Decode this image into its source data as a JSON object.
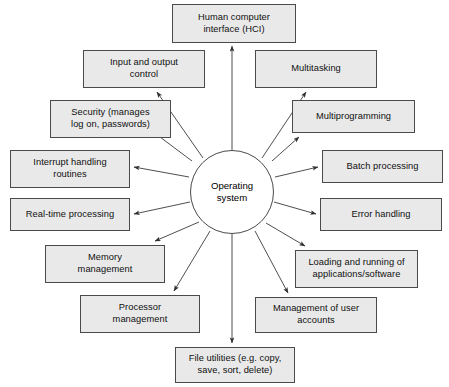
{
  "diagram": {
    "type": "hub-and-spoke",
    "canvas": {
      "width": 449,
      "height": 387,
      "background": "#ffffff"
    },
    "style": {
      "box_fill": "#e9e9e9",
      "box_border": "#4a4a4a",
      "center_fill": "#ffffff",
      "center_border": "#4a4a4a",
      "edge_color": "#3a3a3a",
      "text_color": "#101010"
    },
    "center": {
      "label": "Operating\nsystem",
      "cx": 232,
      "cy": 192,
      "r": 42
    },
    "nodes": [
      {
        "id": "human-computer-interface",
        "label": "Human computer\ninterface (HCI)",
        "x": 172,
        "y": 4,
        "w": 124,
        "h": 39,
        "arrow_from": [
          232,
          150
        ],
        "arrow_to": [
          232,
          46
        ]
      },
      {
        "id": "input-and-output-control",
        "label": "Input and output\ncontrol",
        "x": 83,
        "y": 50,
        "w": 122,
        "h": 38,
        "arrow_from": [
          203,
          158
        ],
        "arrow_to": [
          157,
          92
        ]
      },
      {
        "id": "multitasking",
        "label": "Multitasking",
        "x": 255,
        "y": 50,
        "w": 122,
        "h": 38,
        "arrow_from": [
          262,
          158
        ],
        "arrow_to": [
          306,
          92
        ]
      },
      {
        "id": "security",
        "label": "Security (manages\nlog on, passwords)",
        "x": 50,
        "y": 100,
        "w": 121,
        "h": 38,
        "arrow_from": [
          192,
          161
        ],
        "arrow_to": [
          152,
          131
        ]
      },
      {
        "id": "multiprogramming",
        "label": "Multiprogramming",
        "x": 292,
        "y": 100,
        "w": 123,
        "h": 33,
        "arrow_from": [
          272,
          161
        ],
        "arrow_to": [
          299,
          137
        ]
      },
      {
        "id": "interrupt-handling-routines",
        "label": "Interrupt handling\nroutines",
        "x": 10,
        "y": 150,
        "w": 120,
        "h": 38,
        "arrow_from": [
          189,
          177
        ],
        "arrow_to": [
          134,
          167
        ]
      },
      {
        "id": "batch-processing",
        "label": "Batch processing",
        "x": 322,
        "y": 150,
        "w": 121,
        "h": 33,
        "arrow_from": [
          275,
          177
        ],
        "arrow_to": [
          318,
          167
        ]
      },
      {
        "id": "real-time-processing",
        "label": "Real-time processing",
        "x": 10,
        "y": 198,
        "w": 120,
        "h": 33,
        "arrow_from": [
          190,
          202
        ],
        "arrow_to": [
          134,
          214
        ]
      },
      {
        "id": "error-handling",
        "label": "Error handling",
        "x": 320,
        "y": 198,
        "w": 122,
        "h": 33,
        "arrow_from": [
          274,
          202
        ],
        "arrow_to": [
          316,
          214
        ]
      },
      {
        "id": "memory-management",
        "label": "Memory\nmanagement",
        "x": 45,
        "y": 245,
        "w": 120,
        "h": 38,
        "arrow_from": [
          199,
          222
        ],
        "arrow_to": [
          155,
          241
        ]
      },
      {
        "id": "loading-and-running",
        "label": "Loading and running of\napplications/software",
        "x": 295,
        "y": 250,
        "w": 123,
        "h": 38,
        "arrow_from": [
          266,
          223
        ],
        "arrow_to": [
          305,
          246
        ]
      },
      {
        "id": "processor-management",
        "label": "Processor\nmanagement",
        "x": 80,
        "y": 295,
        "w": 120,
        "h": 38,
        "arrow_from": [
          210,
          231
        ],
        "arrow_to": [
          174,
          291
        ]
      },
      {
        "id": "management-of-user-accounts",
        "label": "Management of user\naccounts",
        "x": 255,
        "y": 297,
        "w": 122,
        "h": 36,
        "arrow_from": [
          255,
          231
        ],
        "arrow_to": [
          288,
          293
        ]
      },
      {
        "id": "file-utilities",
        "label": "File utilities (e.g. copy,\nsave, sort, delete)",
        "x": 175,
        "y": 347,
        "w": 120,
        "h": 36,
        "arrow_from": [
          232,
          234
        ],
        "arrow_to": [
          232,
          343
        ]
      }
    ]
  }
}
